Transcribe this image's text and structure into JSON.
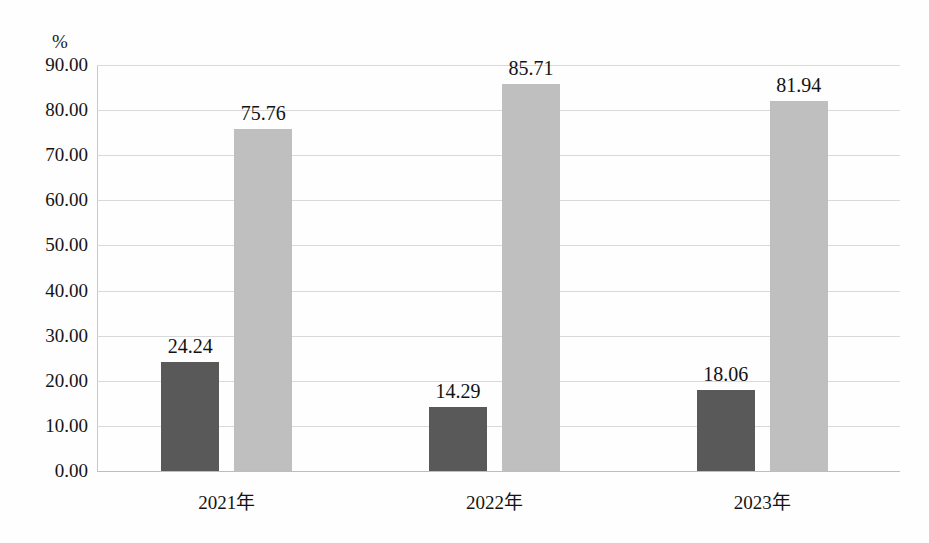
{
  "chart_data": {
    "type": "bar",
    "title": "",
    "subtitle": "",
    "xlabel": "",
    "ylabel": "%",
    "unit_label": "%",
    "categories": [
      "2021年",
      "2022年",
      "2023年"
    ],
    "series": [
      {
        "name": "series-a",
        "color": "#595959",
        "values": [
          24.24,
          14.29,
          18.06
        ],
        "labels": [
          "24.24",
          "14.29",
          "18.06"
        ]
      },
      {
        "name": "series-b",
        "color": "#bfbfbf",
        "values": [
          75.76,
          85.71,
          81.94
        ],
        "labels": [
          "75.76",
          "85.71",
          "81.94"
        ]
      }
    ],
    "ylim": [
      0,
      90
    ],
    "ytick_step": 10,
    "ytick_labels": [
      "90.00",
      "80.00",
      "70.00",
      "60.00",
      "50.00",
      "40.00",
      "30.00",
      "20.00",
      "10.00",
      "0.00"
    ],
    "ytick_values": [
      90,
      80,
      70,
      60,
      50,
      40,
      30,
      20,
      10,
      0
    ],
    "grid": true,
    "legend": "none",
    "gridline_color": "#d9d9d9",
    "axis_color": "#bdbdbd",
    "background_color": "#fefefe"
  }
}
